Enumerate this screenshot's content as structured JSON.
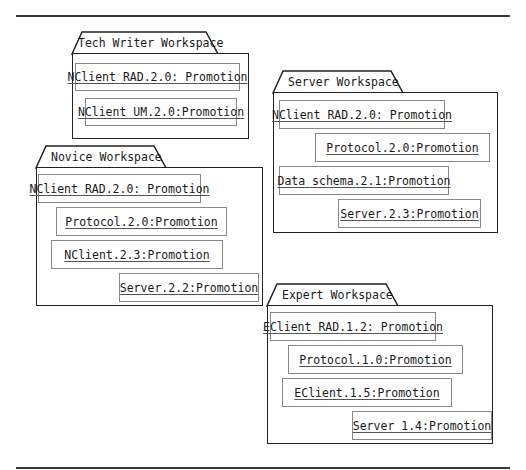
{
  "diagram": {
    "type": "UML package diagram",
    "packages": [
      {
        "id": "tech-writer",
        "name": "Tech Writer Workspace",
        "objects": [
          "NClient RAD.2.0: Promotion",
          "NClient UM.2.0:Promotion"
        ]
      },
      {
        "id": "server",
        "name": "Server Workspace",
        "objects": [
          "NClient RAD.2.0: Promotion",
          "Protocol.2.0:Promotion",
          "Data schema.2.1:Promotion",
          "Server.2.3:Promotion"
        ]
      },
      {
        "id": "novice",
        "name": "Novice Workspace",
        "objects": [
          "NClient RAD.2.0: Promotion",
          "Protocol.2.0:Promotion",
          "NClient.2.3:Promotion",
          "Server.2.2:Promotion"
        ]
      },
      {
        "id": "expert",
        "name": "Expert Workspace",
        "objects": [
          "EClient RAD.1.2: Promotion",
          "Protocol.1.0:Promotion",
          "EClient.1.5:Promotion",
          "Server 1.4:Promotion"
        ]
      }
    ]
  }
}
